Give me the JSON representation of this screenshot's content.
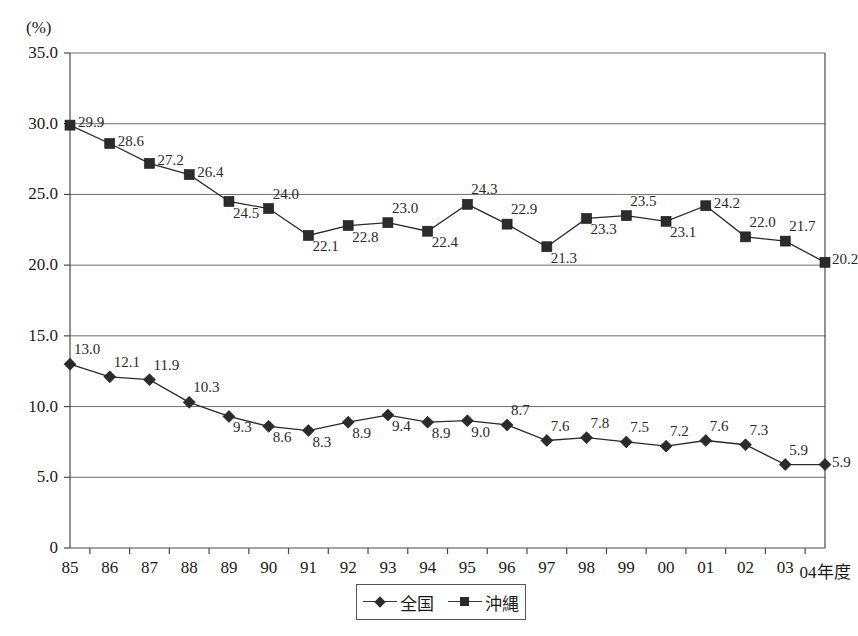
{
  "chart_data": {
    "type": "line",
    "title": "",
    "xlabel": "",
    "ylabel": "(%)",
    "unit_label": "(%)",
    "x_axis_suffix": "年度",
    "categories": [
      "85",
      "86",
      "87",
      "88",
      "89",
      "90",
      "91",
      "92",
      "93",
      "94",
      "95",
      "96",
      "97",
      "98",
      "99",
      "00",
      "01",
      "02",
      "03",
      "04"
    ],
    "x_tick_labels": [
      "85",
      "86",
      "87",
      "88",
      "89",
      "90",
      "91",
      "92",
      "93",
      "94",
      "95",
      "96",
      "97",
      "98",
      "99",
      "00",
      "01",
      "02",
      "03",
      "04年度"
    ],
    "ylim": [
      0,
      35
    ],
    "y_ticks": [
      0,
      5,
      10,
      15,
      20,
      25,
      30,
      35
    ],
    "y_tick_labels": [
      "0",
      "5.0",
      "10.0",
      "15.0",
      "20.0",
      "25.0",
      "30.0",
      "35.0"
    ],
    "grid": true,
    "legend_position": "bottom-center",
    "series": [
      {
        "name": "全国",
        "marker": "diamond",
        "color": "#2b2b2b",
        "values": [
          13.0,
          12.1,
          11.9,
          10.3,
          9.3,
          8.6,
          8.3,
          8.9,
          9.4,
          8.9,
          9.0,
          8.7,
          7.6,
          7.8,
          7.5,
          7.2,
          7.6,
          7.3,
          5.9,
          5.9
        ],
        "labels": [
          "13.0",
          "12.1",
          "11.9",
          "10.3",
          "9.3",
          "8.6",
          "8.3",
          "8.9",
          "9.4",
          "8.9",
          "9.0",
          "8.7",
          "7.6",
          "7.8",
          "7.5",
          "7.2",
          "7.6",
          "7.3",
          "5.9",
          "5.9"
        ],
        "label_placement": [
          "above",
          "above",
          "above",
          "above",
          "below",
          "below",
          "below",
          "below",
          "below",
          "below",
          "below",
          "above",
          "above",
          "above",
          "above",
          "above",
          "above",
          "above",
          "above",
          "right"
        ]
      },
      {
        "name": "沖縄",
        "marker": "square",
        "color": "#2b2b2b",
        "values": [
          29.9,
          28.6,
          27.2,
          26.4,
          24.5,
          24.0,
          22.1,
          22.8,
          23.0,
          22.4,
          24.3,
          22.9,
          21.3,
          23.3,
          23.5,
          23.1,
          24.2,
          22.0,
          21.7,
          20.2
        ],
        "labels": [
          "29.9",
          "28.6",
          "27.2",
          "26.4",
          "24.5",
          "24.0",
          "22.1",
          "22.8",
          "23.0",
          "22.4",
          "24.3",
          "22.9",
          "21.3",
          "23.3",
          "23.5",
          "23.1",
          "24.2",
          "22.0",
          "21.7",
          "20.2"
        ],
        "label_placement": [
          "right",
          "right",
          "right",
          "right",
          "below",
          "above",
          "below",
          "below",
          "above",
          "below",
          "above",
          "above",
          "below",
          "below",
          "above",
          "below",
          "right",
          "above",
          "above",
          "right"
        ]
      }
    ]
  },
  "legend": {
    "entries": [
      {
        "label": "全国",
        "marker": "diamond"
      },
      {
        "label": "沖縄",
        "marker": "square"
      }
    ]
  },
  "axis": {
    "unit": "(%)"
  }
}
